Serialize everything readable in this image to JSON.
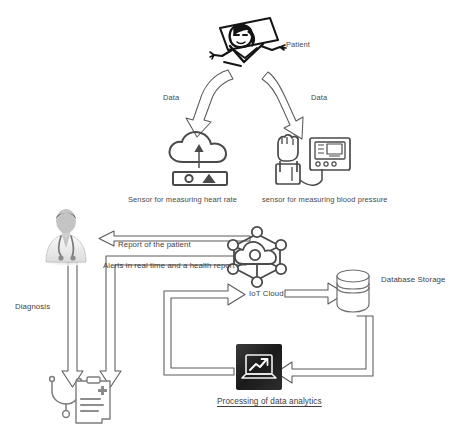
{
  "diagram": {
    "type": "flow-diagram",
    "background_color": "#ffffff",
    "line_color": "#555555",
    "text_color": "#4a4a4a"
  },
  "nodes": {
    "patient": {
      "label": "Patient",
      "icon": "patient-in-bed-icon",
      "description": "hand drawn patient lying in bed on a pillow"
    },
    "heart_rate_sensor": {
      "label": "Sensor for measuring heart rate",
      "icon": "cloud-upload-device-icon"
    },
    "blood_pressure_sensor": {
      "label": "sensor for measuring blood pressure",
      "icon": "blood-pressure-monitor-icon"
    },
    "iot_cloud": {
      "label": "IoT Cloud",
      "icon": "iot-network-cloud-icon"
    },
    "database_storage": {
      "label": "Database Storage",
      "icon": "database-cylinder-icon"
    },
    "data_analytics": {
      "label": "Processing of data analytics",
      "icon": "laptop-chart-icon"
    },
    "doctor": {
      "label": "",
      "icon": "doctor-avatar-icon",
      "description": "doctor wearing white coat with stethoscope"
    },
    "medical_record": {
      "label": "",
      "icon": "medical-clipboard-stethoscope-icon",
      "description": "clipboard health record with stethoscope"
    }
  },
  "edges": [
    {
      "id": "patient-to-heart-rate",
      "label": "Data",
      "from": "patient",
      "to": "heart_rate_sensor"
    },
    {
      "id": "patient-to-blood-pressure",
      "label": "Data",
      "from": "patient",
      "to": "blood_pressure_sensor"
    },
    {
      "id": "iotcloud-to-doctor",
      "label": "Report of the patient",
      "from": "iot_cloud",
      "to": "doctor"
    },
    {
      "id": "iotcloud-alerts",
      "label": "Alerts in real time and a health report",
      "from": "iot_cloud",
      "to": "medical_record"
    },
    {
      "id": "doctor-to-record",
      "label": "Diagnosis",
      "from": "doctor",
      "to": "medical_record"
    },
    {
      "id": "iotcloud-to-database",
      "label": "",
      "from": "iot_cloud",
      "to": "database_storage"
    },
    {
      "id": "database-to-analytics",
      "label": "",
      "from": "database_storage",
      "to": "data_analytics"
    },
    {
      "id": "analytics-to-iotcloud",
      "label": "",
      "from": "data_analytics",
      "to": "iot_cloud"
    }
  ]
}
